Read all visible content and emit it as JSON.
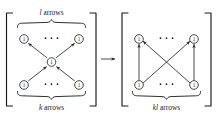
{
  "figure": {
    "caption_text": "",
    "background_color": "#ffffff",
    "ink_color": "#1a1a1a",
    "left_panel": {
      "name": "composable-arrows-quiver",
      "top_brace_label": "l arrows",
      "top_brace_label_italic_part": "l",
      "top_brace_label_rest": " arrows",
      "bottom_brace_label": "k arrows",
      "bottom_brace_label_italic_part": "k",
      "bottom_brace_label_rest": " arrows",
      "nodes": [
        {
          "id": "top-left",
          "label": "1",
          "x": 24,
          "y": 39
        },
        {
          "id": "top-right",
          "label": "1",
          "x": 79,
          "y": 39
        },
        {
          "id": "center",
          "label": "1",
          "x": 51.5,
          "y": 62
        },
        {
          "id": "bottom-left",
          "label": "1",
          "x": 24,
          "y": 85
        },
        {
          "id": "bottom-right",
          "label": "1",
          "x": 79,
          "y": 85
        }
      ],
      "ellipsis_top": "...",
      "ellipsis_bottom": "...",
      "edges": [
        {
          "from": "center",
          "to": "top-left",
          "direction": "up-left"
        },
        {
          "from": "center",
          "to": "top-right",
          "direction": "up-right"
        },
        {
          "from": "bottom-left",
          "to": "center",
          "direction": "up-right"
        },
        {
          "from": "bottom-right",
          "to": "center",
          "direction": "up-left"
        }
      ]
    },
    "transform_arrow": {
      "name": "implies-arrow",
      "glyph": "→",
      "x": 104,
      "y": 59
    },
    "right_panel": {
      "name": "composed-arrows-quiver",
      "bottom_brace_label": "kl arrows",
      "bottom_brace_label_italic_part": "kl",
      "bottom_brace_label_rest": " arrows",
      "nodes": [
        {
          "id": "top-left",
          "label": "1",
          "x": 139,
          "y": 39
        },
        {
          "id": "top-right",
          "label": "1",
          "x": 194,
          "y": 39
        },
        {
          "id": "bottom-left",
          "label": "1",
          "x": 139,
          "y": 85
        },
        {
          "id": "bottom-right",
          "label": "1",
          "x": 194,
          "y": 85
        }
      ],
      "ellipsis_top": "...",
      "ellipsis_bottom": "...",
      "edges": [
        {
          "from": "bottom-left",
          "to": "top-left",
          "direction": "up"
        },
        {
          "from": "bottom-right",
          "to": "top-right",
          "direction": "up"
        },
        {
          "from": "bottom-left",
          "to": "top-right",
          "direction": "up-right"
        },
        {
          "from": "bottom-right",
          "to": "top-left",
          "direction": "up-left"
        }
      ]
    }
  }
}
